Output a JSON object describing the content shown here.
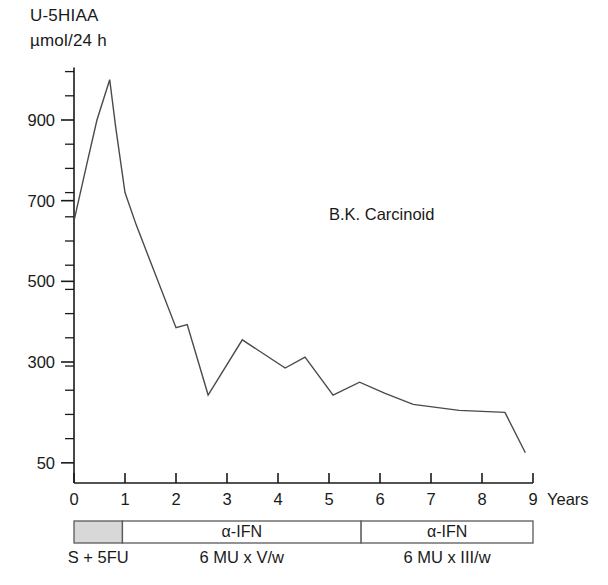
{
  "chart_data": {
    "type": "line",
    "title": "B.K. Carcinoid",
    "ylabel_line1": "U-5HIAA",
    "ylabel_line2": "µmol/24 h",
    "xlabel": "Years",
    "xlim": [
      0,
      9
    ],
    "ylim": [
      0,
      1030
    ],
    "grid": false,
    "legend": "none",
    "yticks_labeled": [
      50,
      300,
      500,
      700,
      900
    ],
    "ytick_labels": [
      "50",
      "300",
      "500",
      "700",
      "900"
    ],
    "yticks_minor": [
      110,
      170,
      230,
      290,
      360,
      420,
      480,
      540,
      600,
      660,
      720,
      780,
      840,
      960,
      1020
    ],
    "xticks": [
      0,
      1,
      2,
      3,
      4,
      5,
      6,
      7,
      8,
      9
    ],
    "xtick_labels": [
      "0",
      "1",
      "2",
      "3",
      "4",
      "5",
      "6",
      "7",
      "8",
      "9"
    ],
    "series": [
      {
        "name": "U-5HIAA",
        "x": [
          0.0,
          0.25,
          0.45,
          0.7,
          0.82,
          1.0,
          1.22,
          2.0,
          2.22,
          2.63,
          3.3,
          4.14,
          4.53,
          5.08,
          5.6,
          6.1,
          6.65,
          7.55,
          8.45,
          8.85
        ],
        "y": [
          650,
          790,
          900,
          1000,
          880,
          720,
          640,
          385,
          393,
          218,
          355,
          285,
          312,
          218,
          250,
          222,
          195,
          180,
          175,
          75
        ]
      }
    ],
    "treatments": [
      {
        "id": "s5fu",
        "label": "",
        "caption": "S + 5FU",
        "start": 0.0,
        "end": 0.95,
        "shaded": true
      },
      {
        "id": "ifn1",
        "label": "α-IFN",
        "caption": "6 MU x V/w",
        "start": 0.95,
        "end": 5.63,
        "shaded": false
      },
      {
        "id": "ifn2",
        "label": "α-IFN",
        "caption": "6 MU x III/w",
        "start": 5.63,
        "end": 9.0,
        "shaded": false
      }
    ]
  },
  "colors": {
    "axis": "#1a1a1a",
    "line": "#4a4a4a",
    "bar_stroke": "#5a5a5a",
    "bar_fill": "#ffffff",
    "shaded_fill": "#d8d8d8",
    "background": "#ffffff"
  }
}
